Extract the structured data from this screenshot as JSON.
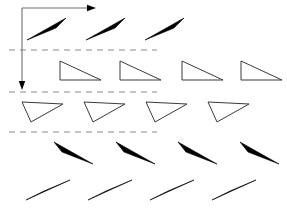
{
  "figure": {
    "canvas": {
      "width": 287,
      "height": 218,
      "background": "#ffffff"
    },
    "colors": {
      "filled_triangle": "#000000",
      "outline_triangle_stroke": "#3a3a3a",
      "outline_triangle_fill": "#ffffff",
      "axis": "#6e6e6e",
      "arrow_head": "#000000",
      "dashed_guide": "#8a8a8a"
    },
    "axes": {
      "origin": {
        "x": 22,
        "y": 8
      },
      "x_axis": {
        "label": "",
        "from_x": 22,
        "to_x": 96,
        "y": 8,
        "arrow": "right"
      },
      "y_axis": {
        "label": "",
        "x": 22,
        "from_y": 8,
        "to_y": 90,
        "arrow": "down"
      }
    },
    "guides": [
      {
        "name": "dashed-guide-1",
        "y": 50,
        "x1": 9,
        "x2": 157
      },
      {
        "name": "dashed-guide-2",
        "y": 92,
        "x1": 9,
        "x2": 157
      },
      {
        "name": "dashed-guide-3",
        "y": 132,
        "x1": 9,
        "x2": 157
      }
    ],
    "rows": [
      {
        "name": "row-1",
        "style": "filled",
        "count": 3,
        "triangles": [
          {
            "points": "27,40 66,18 56,28"
          },
          {
            "points": "86,40 125,18 115,28"
          },
          {
            "points": "145,40 184,18 174,28"
          },
          {
            "points": "214,40 253,18 243,28"
          }
        ]
      },
      {
        "name": "row-2",
        "style": "outline",
        "count": 4,
        "triangles": [
          {
            "points": "60,61 60,80 101,80"
          },
          {
            "points": "120,61 120,80 161,80"
          },
          {
            "points": "182,61 182,80 223,80"
          },
          {
            "points": "241,61 241,80 282,80"
          }
        ]
      },
      {
        "name": "row-3",
        "style": "outline",
        "count": 4,
        "triangles": [
          {
            "points": "22,102 31,122 63,104"
          },
          {
            "points": "84,102 93,122 125,104"
          },
          {
            "points": "146,102 155,122 187,104"
          },
          {
            "points": "208,102 217,122 249,104"
          }
        ]
      },
      {
        "name": "row-4",
        "style": "filled",
        "count": 4,
        "triangles": [
          {
            "points": "54,142 93,164 62,152"
          },
          {
            "points": "116,142 155,164 124,152"
          },
          {
            "points": "178,142 217,164 186,152"
          },
          {
            "points": "240,142 279,164 248,152"
          }
        ]
      },
      {
        "name": "row-5",
        "style": "filled",
        "count": 4,
        "triangles": [
          {
            "points": "26,200 70,180 44,191"
          },
          {
            "points": "88,200 132,180 106,191"
          },
          {
            "points": "150,200 194,180 168,191"
          },
          {
            "points": "212,200 256,180 230,191"
          }
        ]
      }
    ]
  }
}
